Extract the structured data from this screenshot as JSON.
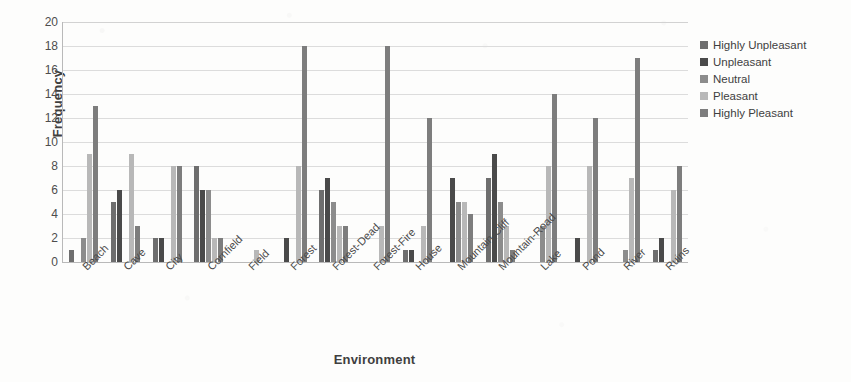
{
  "chart_data": {
    "type": "bar",
    "title": "",
    "xlabel": "Environment",
    "ylabel": "Frequency",
    "ylim": [
      0,
      20
    ],
    "ytick_step": 2,
    "yticks": [
      0,
      2,
      4,
      6,
      8,
      10,
      12,
      14,
      16,
      18,
      20
    ],
    "grid": true,
    "grid_axis": "y",
    "legend_position": "right",
    "categories": [
      "Beach",
      "Cave",
      "City",
      "Cornfield",
      "Field",
      "Forest",
      "Forest-Dead",
      "Forest-Fire",
      "House",
      "Mountain-Cliff",
      "Mountain-Road",
      "Lake",
      "Pond",
      "River",
      "Ruins"
    ],
    "series": [
      {
        "name": "Highly Unpleasant",
        "color": "#6e6e6e",
        "values": [
          1,
          5,
          2,
          8,
          0,
          0,
          6,
          0,
          1,
          0,
          7,
          0,
          0,
          0,
          1
        ]
      },
      {
        "name": "Unpleasant",
        "color": "#4a4a4a",
        "values": [
          0,
          6,
          2,
          6,
          0,
          2,
          7,
          0,
          1,
          7,
          9,
          0,
          2,
          0,
          2
        ]
      },
      {
        "name": "Neutral",
        "color": "#8c8c8c",
        "values": [
          2,
          0,
          0,
          6,
          0,
          0,
          5,
          0,
          0,
          5,
          5,
          3,
          0,
          1,
          0
        ]
      },
      {
        "name": "Pleasant",
        "color": "#b8b8b8",
        "values": [
          9,
          9,
          8,
          2,
          1,
          8,
          3,
          3,
          3,
          5,
          3,
          8,
          8,
          7,
          6
        ]
      },
      {
        "name": "Highly Pleasant",
        "color": "#7d7d7d",
        "values": [
          13,
          3,
          8,
          2,
          0,
          18,
          3,
          18,
          12,
          4,
          1,
          14,
          12,
          17,
          8
        ]
      }
    ]
  },
  "legend": {
    "items": [
      {
        "label": "Highly Unpleasant",
        "color": "#6e6e6e"
      },
      {
        "label": "Unpleasant",
        "color": "#4a4a4a"
      },
      {
        "label": "Neutral",
        "color": "#8c8c8c"
      },
      {
        "label": "Pleasant",
        "color": "#b8b8b8"
      },
      {
        "label": "Highly Pleasant",
        "color": "#7d7d7d"
      }
    ]
  },
  "colors": {
    "axis": "#b9b9b9",
    "grid": "#dcdcdc",
    "text": "#4a4a4a",
    "background": "#fdfdfc"
  }
}
